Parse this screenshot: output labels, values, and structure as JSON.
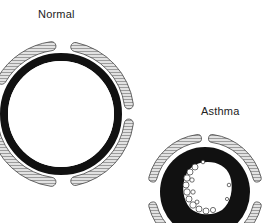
{
  "labels": {
    "normal": "Normal",
    "asthma": "Asthma"
  },
  "colors": {
    "wall": "#111111",
    "muscle_fill": "#d8d8d8",
    "muscle_stroke": "#444444",
    "lumen": "#ffffff",
    "mucus_stroke": "#333333"
  },
  "diagram": {
    "type": "airway-cross-section-comparison",
    "panels": [
      {
        "name": "normal",
        "muscle_bands": 4,
        "lumen": "wide open, thin wall"
      },
      {
        "name": "asthma",
        "muscle_bands": 4,
        "lumen": "narrowed, thickened wall with mucus lining"
      }
    ]
  }
}
